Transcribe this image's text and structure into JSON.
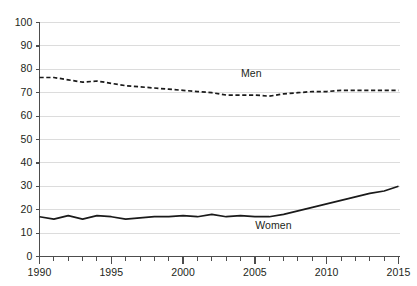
{
  "chart_data": {
    "type": "line",
    "title": "",
    "subtitle": "",
    "xlabel": "",
    "ylabel": "",
    "xlim": [
      1990,
      2015
    ],
    "ylim": [
      0,
      100
    ],
    "grid": true,
    "grid_axis": "y",
    "legend": "inline-labels",
    "x": [
      1990,
      1991,
      1992,
      1993,
      1994,
      1995,
      1996,
      1997,
      1998,
      1999,
      2000,
      2001,
      2002,
      2003,
      2004,
      2005,
      2006,
      2007,
      2008,
      2009,
      2010,
      2011,
      2012,
      2013,
      2014,
      2015
    ],
    "ytick_labels": [
      "0",
      "10",
      "20",
      "30",
      "40",
      "50",
      "60",
      "70",
      "80",
      "90",
      "100"
    ],
    "ytick_values": [
      0,
      10,
      20,
      30,
      40,
      50,
      60,
      70,
      80,
      90,
      100
    ],
    "xtick_labels": [
      "1990",
      "1995",
      "2000",
      "2005",
      "2010",
      "2015"
    ],
    "xtick_values": [
      1990,
      1995,
      2000,
      2005,
      2010,
      2015
    ],
    "xtick_minor_step": 1,
    "series": [
      {
        "name": "Men",
        "label": "Men",
        "style": "dashed",
        "color": "#1a1a1a",
        "label_x": 2005,
        "label_y": 78,
        "values": [
          76.5,
          76.5,
          75.5,
          74.5,
          75,
          74,
          73,
          72.5,
          72,
          71.5,
          71,
          70.5,
          70,
          69,
          69,
          69,
          68.5,
          69.5,
          70,
          70.5,
          70.5,
          71,
          71,
          71,
          71,
          71
        ]
      },
      {
        "name": "Women",
        "label": "Women",
        "style": "solid",
        "color": "#1a1a1a",
        "label_x": 2006,
        "label_y": 13,
        "values": [
          17,
          16,
          17.5,
          16,
          17.5,
          17,
          16,
          16.5,
          17,
          17,
          17.5,
          17,
          18,
          17,
          17.5,
          17,
          17,
          18,
          19.5,
          21,
          22.5,
          24,
          25.5,
          27,
          28,
          30
        ]
      }
    ]
  },
  "axes": {
    "y_axis_name": "y-axis",
    "x_axis_name": "x-axis"
  }
}
